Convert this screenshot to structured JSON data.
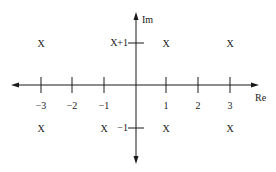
{
  "diagram": {
    "type": "complex-plane",
    "axes": {
      "horizontal_label": "Re",
      "vertical_label": "Im",
      "color": "#1a1a1a"
    },
    "x_ticks": [
      {
        "value": -3,
        "label": "−3"
      },
      {
        "value": -2,
        "label": "−2"
      },
      {
        "value": -1,
        "label": "−1"
      },
      {
        "value": 1,
        "label": "1"
      },
      {
        "value": 2,
        "label": "2"
      },
      {
        "value": 3,
        "label": "3"
      }
    ],
    "y_ticks": [
      {
        "value": 1,
        "label": "X+1"
      },
      {
        "value": -1,
        "label": "−1"
      }
    ],
    "marks": [
      {
        "re": -3,
        "im": 1,
        "symbol": "X"
      },
      {
        "re": 1,
        "im": 1,
        "symbol": "X"
      },
      {
        "re": 3,
        "im": 1,
        "symbol": "X"
      },
      {
        "re": -3,
        "im": -1,
        "symbol": "X"
      },
      {
        "re": -1,
        "im": -1,
        "symbol": "X"
      },
      {
        "re": 1,
        "im": -1,
        "symbol": "X"
      },
      {
        "re": 3,
        "im": -1,
        "symbol": "X"
      }
    ]
  }
}
